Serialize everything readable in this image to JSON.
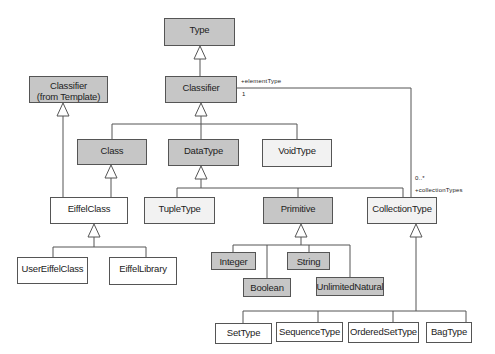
{
  "diagram": {
    "type": "UML class diagram (generalization hierarchy)",
    "colors": {
      "abstract_fill": "#c6c6c6",
      "concrete_fill": "#f2f2f2",
      "new_fill": "#ffffff",
      "stroke": "#555555"
    },
    "classes": {
      "type": {
        "label": "Type"
      },
      "classifier": {
        "label": "Classifier"
      },
      "classifier_template": {
        "line1": "Classifier",
        "line2": "(from Template)"
      },
      "class": {
        "label": "Class"
      },
      "datatype": {
        "label": "DataType"
      },
      "voidtype": {
        "label": "VoidType"
      },
      "eiffelclass": {
        "label": "EiffelClass"
      },
      "tupletype": {
        "label": "TupleType"
      },
      "primitive": {
        "label": "Primitive"
      },
      "collectiontype": {
        "label": "CollectionType"
      },
      "usereiffelclass": {
        "label": "UserEiffelClass"
      },
      "eiffellibrary": {
        "label": "EiffelLibrary"
      },
      "integer": {
        "label": "Integer"
      },
      "string": {
        "label": "String"
      },
      "boolean": {
        "label": "Boolean"
      },
      "unlimitednatural": {
        "label": "UnlimitedNatural"
      },
      "settype": {
        "label": "SetType"
      },
      "sequencetype": {
        "label": "SequenceType"
      },
      "orderedsettype": {
        "label": "OrderedSetType"
      },
      "bagtype": {
        "label": "BagType"
      }
    },
    "association": {
      "role_element": "+elementType",
      "mult_element": "1",
      "mult_collection": "0..*",
      "role_collection": "+collectionTypes"
    },
    "generalizations": [
      [
        "Classifier",
        "Type"
      ],
      [
        "Class",
        "Classifier"
      ],
      [
        "DataType",
        "Classifier"
      ],
      [
        "VoidType",
        "Classifier"
      ],
      [
        "EiffelClass",
        "Classifier (from Template)"
      ],
      [
        "EiffelClass",
        "Class"
      ],
      [
        "TupleType",
        "DataType"
      ],
      [
        "Primitive",
        "DataType"
      ],
      [
        "CollectionType",
        "DataType"
      ],
      [
        "UserEiffelClass",
        "EiffelClass"
      ],
      [
        "EiffelLibrary",
        "EiffelClass"
      ],
      [
        "Integer",
        "Primitive"
      ],
      [
        "Boolean",
        "Primitive"
      ],
      [
        "String",
        "Primitive"
      ],
      [
        "UnlimitedNatural",
        "Primitive"
      ],
      [
        "SetType",
        "CollectionType"
      ],
      [
        "SequenceType",
        "CollectionType"
      ],
      [
        "OrderedSetType",
        "CollectionType"
      ],
      [
        "BagType",
        "CollectionType"
      ]
    ]
  }
}
